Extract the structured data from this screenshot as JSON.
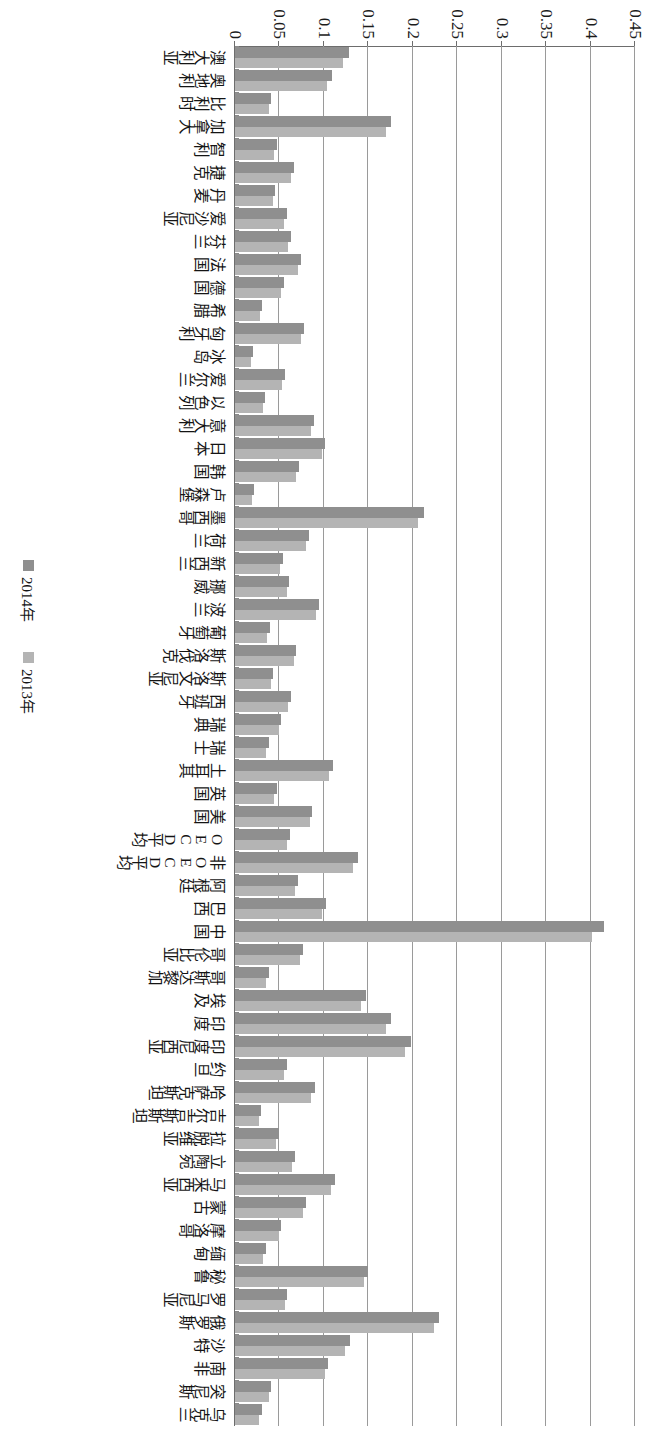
{
  "chart_data": {
    "type": "bar",
    "orientation": "vertical",
    "title": "",
    "xlabel": "",
    "ylabel": "",
    "ylim": [
      0,
      0.45
    ],
    "grid": true,
    "legend_position": "bottom-right",
    "tick_labels": [
      "0.45",
      "0.4",
      "0.35",
      "0.3",
      "0.25",
      "0.2",
      "0.15",
      "0.1",
      "0.05",
      "0"
    ],
    "tick_values": [
      0.45,
      0.4,
      0.35,
      0.3,
      0.25,
      0.2,
      0.15,
      0.1,
      0.05,
      0
    ],
    "categories": [
      "澳大利亚",
      "奥地利",
      "比利时",
      "加拿大",
      "智利",
      "捷克",
      "丹麦",
      "爱沙尼亚",
      "芬兰",
      "法国",
      "德国",
      "希腊",
      "匈牙利",
      "冰岛",
      "爱尔兰",
      "以色列",
      "意大利",
      "日本",
      "韩国",
      "卢森堡",
      "墨西哥",
      "荷兰",
      "新西兰",
      "挪威",
      "波兰",
      "葡萄牙",
      "斯洛伐克",
      "斯洛文尼亚",
      "西班牙",
      "瑞典",
      "瑞士",
      "土耳其",
      "英国",
      "美国",
      "OECD平均",
      "非OECD平均",
      "阿根廷",
      "巴西",
      "中国",
      "哥伦比亚",
      "哥斯达黎加",
      "埃及",
      "印度",
      "印度尼西亚",
      "约旦",
      "哈萨克斯坦",
      "吉尔吉斯斯坦",
      "拉脱维亚",
      "立陶宛",
      "马来西亚",
      "蒙古",
      "摩洛哥",
      "缅甸",
      "秘鲁",
      "罗马尼亚",
      "俄罗斯",
      "沙特",
      "南非",
      "突尼斯",
      "乌克兰"
    ],
    "series": [
      {
        "name": "2014年",
        "color": "#8f8f8f",
        "values": [
          0.128,
          0.109,
          0.041,
          0.176,
          0.047,
          0.066,
          0.045,
          0.058,
          0.063,
          0.074,
          0.055,
          0.03,
          0.078,
          0.02,
          0.056,
          0.034,
          0.089,
          0.101,
          0.072,
          0.021,
          0.213,
          0.083,
          0.054,
          0.061,
          0.095,
          0.039,
          0.069,
          0.043,
          0.063,
          0.052,
          0.038,
          0.11,
          0.047,
          0.087,
          0.062,
          0.138,
          0.071,
          0.102,
          0.415,
          0.076,
          0.038,
          0.147,
          0.176,
          0.198,
          0.058,
          0.09,
          0.029,
          0.049,
          0.067,
          0.112,
          0.08,
          0.052,
          0.035,
          0.15,
          0.059,
          0.23,
          0.129,
          0.105,
          0.041,
          0.03
        ]
      },
      {
        "name": "2013年",
        "color": "#b4b4b4",
        "values": [
          0.122,
          0.104,
          0.038,
          0.17,
          0.044,
          0.063,
          0.043,
          0.055,
          0.06,
          0.071,
          0.052,
          0.028,
          0.074,
          0.018,
          0.053,
          0.032,
          0.086,
          0.098,
          0.069,
          0.019,
          0.206,
          0.08,
          0.051,
          0.058,
          0.091,
          0.036,
          0.066,
          0.041,
          0.06,
          0.049,
          0.035,
          0.106,
          0.044,
          0.084,
          0.059,
          0.133,
          0.068,
          0.098,
          0.402,
          0.073,
          0.035,
          0.142,
          0.17,
          0.191,
          0.055,
          0.086,
          0.027,
          0.046,
          0.064,
          0.108,
          0.077,
          0.049,
          0.032,
          0.145,
          0.056,
          0.224,
          0.124,
          0.101,
          0.038,
          0.027
        ]
      }
    ]
  },
  "legend": {
    "items": [
      {
        "label": "2014年",
        "swatch": "y2014"
      },
      {
        "label": "2013年",
        "swatch": "y2013"
      }
    ]
  }
}
